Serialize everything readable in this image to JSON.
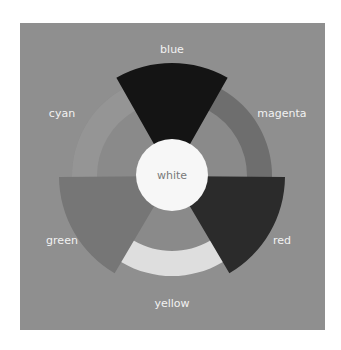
{
  "diagram": {
    "center": {
      "label": "white",
      "color": "#f7f7f7"
    },
    "ring_color": "#7f7f7f",
    "inner_fill": "#8a8a8a",
    "segments": [
      {
        "name": "blue",
        "color": "#141414",
        "kind": "primary",
        "label": "blue"
      },
      {
        "name": "magenta",
        "color": "#6e6e6e",
        "kind": "secondary",
        "label": "magenta"
      },
      {
        "name": "red",
        "color": "#2b2b2b",
        "kind": "primary",
        "label": "red"
      },
      {
        "name": "yellow",
        "color": "#dedede",
        "kind": "secondary",
        "label": "yellow"
      },
      {
        "name": "green",
        "color": "#767676",
        "kind": "primary",
        "label": "green"
      },
      {
        "name": "cyan",
        "color": "#959595",
        "kind": "secondary",
        "label": "cyan"
      }
    ]
  }
}
